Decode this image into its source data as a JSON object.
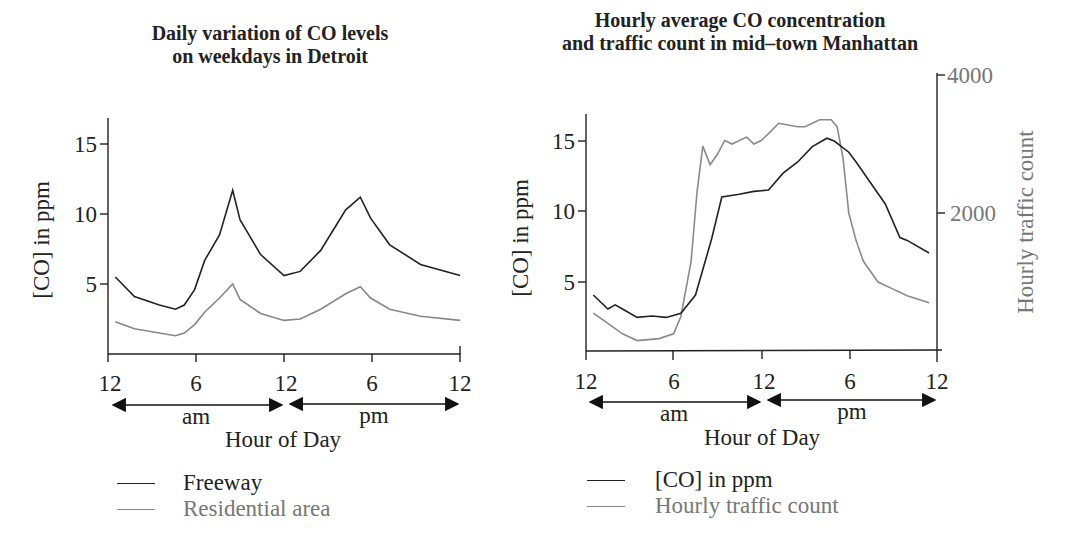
{
  "chart_data": [
    {
      "type": "line",
      "title": "Daily variation of CO levels on weekdays in Detroit",
      "title_lines": [
        "Daily variation of CO levels",
        "on weekdays in Detroit"
      ],
      "xlabel": "Hour of Day",
      "ylabel": "[CO] in ppm",
      "x_tick_labels": [
        "12",
        "6",
        "12",
        "6",
        "12"
      ],
      "x_ticks_hours": [
        0,
        6,
        12,
        18,
        24
      ],
      "period_labels": [
        "am",
        "pm"
      ],
      "y_ticks": [
        5,
        10,
        15
      ],
      "xlim": [
        0,
        24
      ],
      "ylim": [
        0,
        17
      ],
      "grid": false,
      "legend_position": "below",
      "series": [
        {
          "name": "Freeway",
          "color": "#222222",
          "x": [
            0.5,
            1.8,
            3.5,
            4.6,
            5.2,
            5.9,
            6.6,
            7.6,
            8.5,
            9.0,
            10.4,
            12.0,
            13.1,
            14.5,
            16.2,
            17.2,
            17.9,
            19.2,
            21.3,
            24.0
          ],
          "values": [
            5.5,
            4.1,
            3.5,
            3.2,
            3.5,
            4.6,
            6.7,
            8.5,
            11.7,
            9.6,
            7.1,
            5.6,
            5.9,
            7.4,
            10.3,
            11.2,
            9.7,
            7.8,
            6.4,
            5.6
          ]
        },
        {
          "name": "Residential area",
          "color": "#888888",
          "x": [
            0.5,
            1.8,
            3.5,
            4.6,
            5.2,
            5.9,
            6.6,
            7.6,
            8.5,
            9.0,
            10.4,
            12.0,
            13.1,
            14.5,
            16.2,
            17.2,
            17.9,
            19.2,
            21.3,
            24.0
          ],
          "values": [
            2.3,
            1.8,
            1.5,
            1.3,
            1.5,
            2.1,
            3.0,
            4.0,
            5.0,
            3.9,
            2.9,
            2.4,
            2.5,
            3.2,
            4.3,
            4.8,
            4.0,
            3.2,
            2.7,
            2.4
          ]
        }
      ]
    },
    {
      "type": "line",
      "title": "Hourly average CO concentration and traffic count in mid-town Manhattan",
      "title_lines": [
        "Hourly average CO concentration",
        "and traffic count in mid–town Manhattan"
      ],
      "xlabel": "Hour of Day",
      "ylabel": "[CO] in ppm",
      "ylabel_right": "Hourly traffic count",
      "x_tick_labels": [
        "12",
        "6",
        "12",
        "6",
        "12"
      ],
      "x_ticks_hours": [
        0,
        6,
        12,
        18,
        24
      ],
      "period_labels": [
        "am",
        "pm"
      ],
      "y_ticks": [
        5,
        10,
        15
      ],
      "y_right_ticks": [
        2000,
        4000
      ],
      "xlim": [
        0,
        24
      ],
      "ylim": [
        0,
        17
      ],
      "ylim_right": [
        0,
        4000
      ],
      "grid": false,
      "legend_position": "below",
      "series": [
        {
          "name": "[CO] in ppm",
          "axis": "left",
          "color": "#222222",
          "x": [
            0.5,
            1.5,
            2.0,
            2.5,
            3.5,
            4.5,
            5.5,
            6.5,
            7.5,
            8.6,
            9.3,
            10.5,
            11.5,
            12.5,
            13.5,
            14.5,
            15.5,
            16.5,
            17.0,
            18.0,
            18.5,
            19.5,
            20.5,
            21.5,
            22.0,
            23.5
          ],
          "values": [
            4.0,
            3.0,
            3.3,
            3.0,
            2.4,
            2.5,
            2.4,
            2.7,
            4.0,
            8.0,
            11.0,
            11.2,
            11.4,
            11.5,
            12.7,
            13.5,
            14.6,
            15.2,
            15.0,
            14.2,
            13.5,
            12.0,
            10.5,
            8.1,
            7.9,
            7.0
          ]
        },
        {
          "name": "Hourly traffic count",
          "axis": "right",
          "color": "#8a8a8a",
          "x": [
            0.5,
            1.5,
            2.5,
            3.5,
            5.0,
            6.0,
            6.5,
            7.2,
            7.6,
            8.0,
            8.5,
            9.0,
            9.5,
            10.0,
            11.0,
            11.5,
            12.0,
            12.5,
            13.2,
            14.5,
            15.0,
            16.0,
            16.8,
            17.2,
            17.6,
            18.0,
            18.5,
            19.0,
            20.0,
            21.0,
            22.0,
            23.5
          ],
          "values": [
            550,
            400,
            250,
            150,
            180,
            250,
            500,
            1300,
            2300,
            2970,
            2700,
            2850,
            3050,
            3000,
            3100,
            3000,
            3050,
            3150,
            3300,
            3250,
            3250,
            3350,
            3350,
            3250,
            2800,
            2000,
            1600,
            1300,
            1000,
            900,
            800,
            700
          ]
        }
      ]
    }
  ],
  "left_chart": {
    "title_line1": "Daily variation of CO levels",
    "title_line2": "on weekdays in Detroit",
    "ylabel": "[CO] in ppm",
    "y_ticks": [
      "15",
      "10",
      "5"
    ],
    "x_ticks": [
      "12",
      "6",
      "12",
      "6",
      "12"
    ],
    "am": "am",
    "pm": "pm",
    "xlabel": "Hour of Day",
    "legend": [
      "Freeway",
      "Residential area"
    ]
  },
  "right_chart": {
    "title_line1": "Hourly average CO concentration",
    "title_line2": "and traffic count in mid–town Manhattan",
    "ylabel": "[CO] in ppm",
    "ylabel_right": "Hourly traffic count",
    "y_ticks": [
      "15",
      "10",
      "5"
    ],
    "y_right_ticks": [
      "4000",
      "2000"
    ],
    "x_ticks": [
      "12",
      "6",
      "12",
      "6",
      "12"
    ],
    "am": "am",
    "pm": "pm",
    "xlabel": "Hour of Day",
    "legend": [
      "[CO] in ppm",
      "Hourly traffic count"
    ]
  },
  "colors": {
    "dark_series": "#222222",
    "gray_series": "#888888",
    "gray_text": "#777777"
  }
}
